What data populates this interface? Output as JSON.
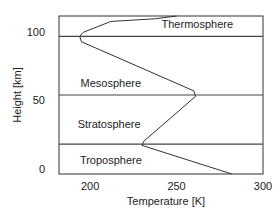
{
  "chart_data": {
    "type": "line",
    "title": "",
    "xlabel": "Temperature [K]",
    "ylabel": "Height [km]",
    "xlim": [
      182,
      300
    ],
    "ylim": [
      -4,
      112
    ],
    "xticks": [
      200,
      250,
      300
    ],
    "yticks": [
      0,
      50,
      100
    ],
    "grid": false,
    "series": [
      {
        "name": "temperature profile",
        "points": [
          [
            282,
            -4
          ],
          [
            230,
            17
          ],
          [
            231,
            20
          ],
          [
            261,
            53
          ],
          [
            260,
            57
          ],
          [
            206,
            87
          ],
          [
            195,
            93
          ],
          [
            194,
            97
          ],
          [
            196,
            100
          ],
          [
            204,
            104
          ],
          [
            212,
            108
          ],
          [
            238,
            110
          ],
          [
            250,
            112
          ]
        ]
      }
    ],
    "boundaries": [
      {
        "name": "tropopause",
        "height": 18
      },
      {
        "name": "stratopause",
        "height": 54
      },
      {
        "name": "mesopause",
        "height": 97
      }
    ],
    "layer_labels": [
      {
        "text": "Troposphere",
        "temperature": 212,
        "height": 6
      },
      {
        "text": "Stratosphere",
        "temperature": 211,
        "height": 33
      },
      {
        "text": "Mesosphere",
        "temperature": 212,
        "height": 63
      },
      {
        "text": "Thermosphere",
        "temperature": 262,
        "height": 106
      }
    ]
  }
}
